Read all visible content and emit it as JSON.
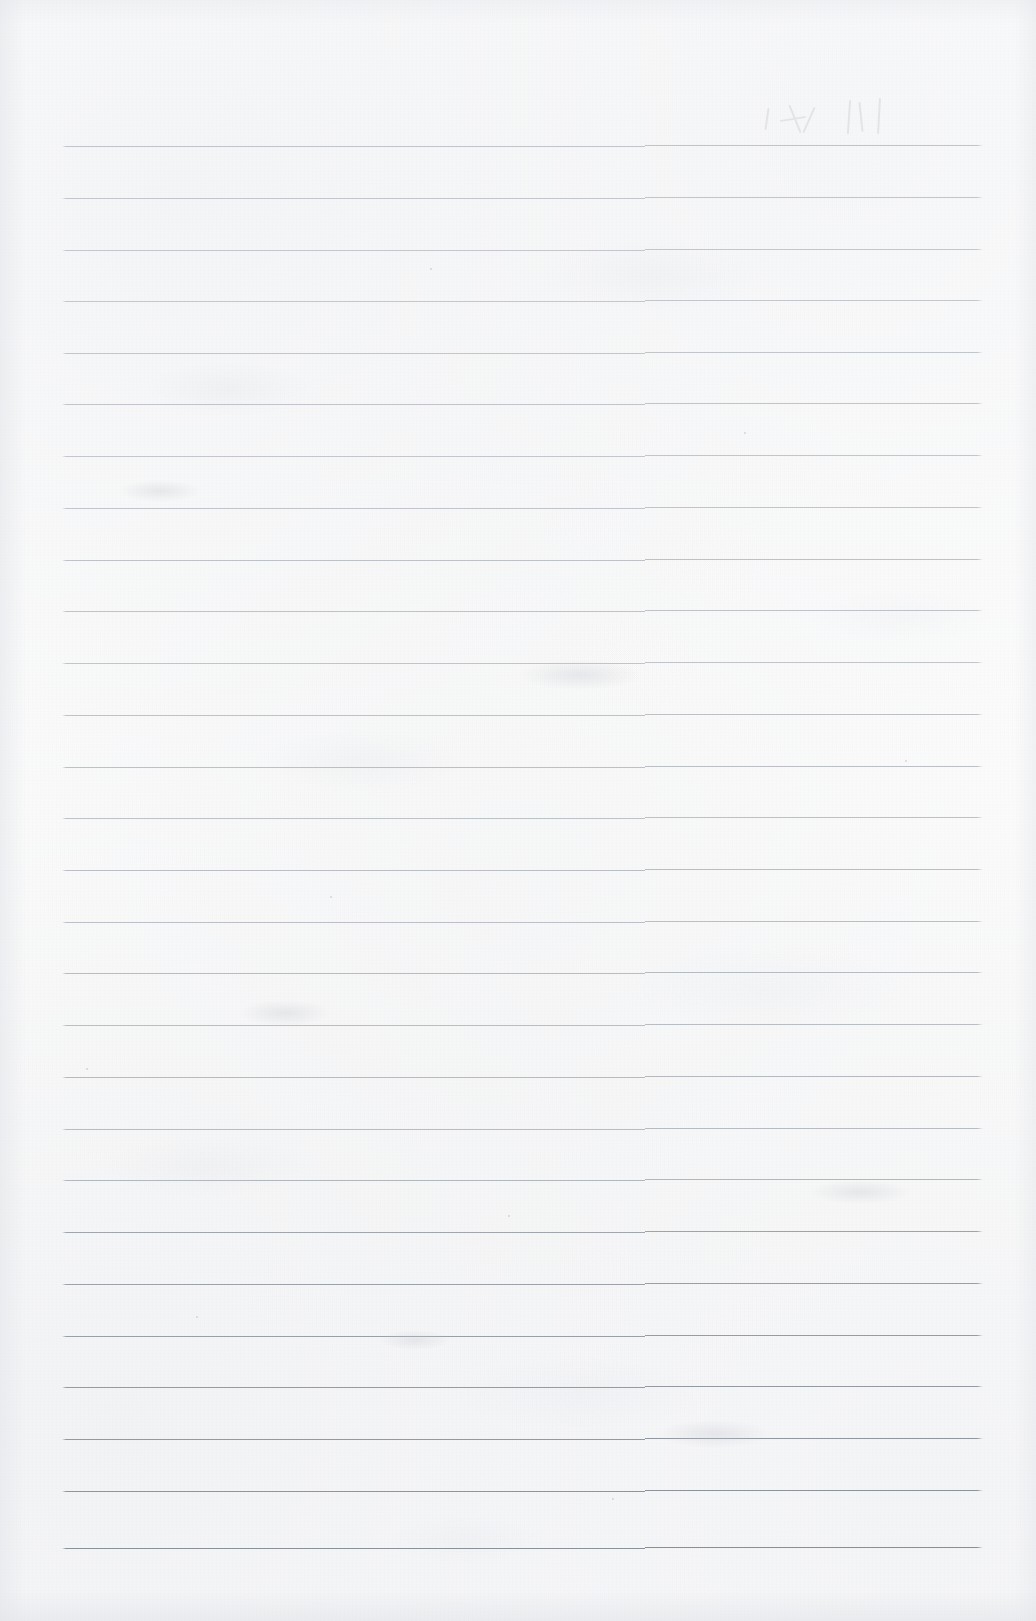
{
  "document": {
    "kind": "scanned-ruled-notebook-page",
    "title": "",
    "visible_text": "",
    "handwriting": "none",
    "page_number": "",
    "orientation": "portrait"
  },
  "page": {
    "width": 1036,
    "height": 1621,
    "background_color": "#fcfcfc",
    "paper_tint": "#f9f9fa",
    "edge_shadow_color": "#e2e5e9"
  },
  "ruling": {
    "style": "wide-ruled horizontal lines",
    "line_color": "#9aa0a8",
    "line_color_dark": "#7e848d",
    "line_thickness_px": 1,
    "line_count": 28,
    "line_left_x": 62,
    "line_right_x": 983,
    "first_line_y": 146,
    "line_spacing_px": 51.9,
    "margin_rule": "none",
    "vertical_margin_line": false,
    "scan_seam_x": 645,
    "scan_seam_offset_px": 2,
    "line_positions_y": [
      146,
      198,
      250,
      301,
      353,
      404,
      456,
      508,
      560,
      611,
      663,
      715,
      767,
      818,
      870,
      922,
      973,
      1025,
      1077,
      1129,
      1180,
      1232,
      1284,
      1336,
      1387,
      1439,
      1491,
      1548
    ],
    "line_opacity": [
      0.62,
      0.6,
      0.58,
      0.58,
      0.6,
      0.62,
      0.6,
      0.62,
      0.66,
      0.64,
      0.62,
      0.66,
      0.68,
      0.66,
      0.7,
      0.68,
      0.72,
      0.7,
      0.74,
      0.72,
      0.78,
      0.76,
      0.8,
      0.82,
      0.86,
      0.88,
      0.92,
      0.96
    ]
  },
  "artifacts": {
    "ghost_marks": {
      "present": true,
      "description": "faint bleed-through pen strokes",
      "x": 760,
      "y": 96,
      "width": 160,
      "height": 48,
      "color": "#b9bdc4"
    },
    "smudges": [
      {
        "x": 240,
        "y": 1000,
        "w": 90,
        "h": 26
      },
      {
        "x": 520,
        "y": 660,
        "w": 120,
        "h": 30
      },
      {
        "x": 810,
        "y": 1180,
        "w": 100,
        "h": 24
      },
      {
        "x": 120,
        "y": 480,
        "w": 80,
        "h": 22
      },
      {
        "x": 660,
        "y": 1420,
        "w": 110,
        "h": 28
      },
      {
        "x": 380,
        "y": 1330,
        "w": 70,
        "h": 20
      }
    ],
    "specks": [
      {
        "x": 196,
        "y": 1316,
        "d": 2
      },
      {
        "x": 508,
        "y": 1215,
        "d": 2
      },
      {
        "x": 744,
        "y": 432,
        "d": 2
      },
      {
        "x": 905,
        "y": 760,
        "d": 2
      },
      {
        "x": 330,
        "y": 896,
        "d": 2
      },
      {
        "x": 612,
        "y": 1498,
        "d": 2
      },
      {
        "x": 86,
        "y": 1068,
        "d": 2
      },
      {
        "x": 430,
        "y": 268,
        "d": 2
      }
    ]
  }
}
